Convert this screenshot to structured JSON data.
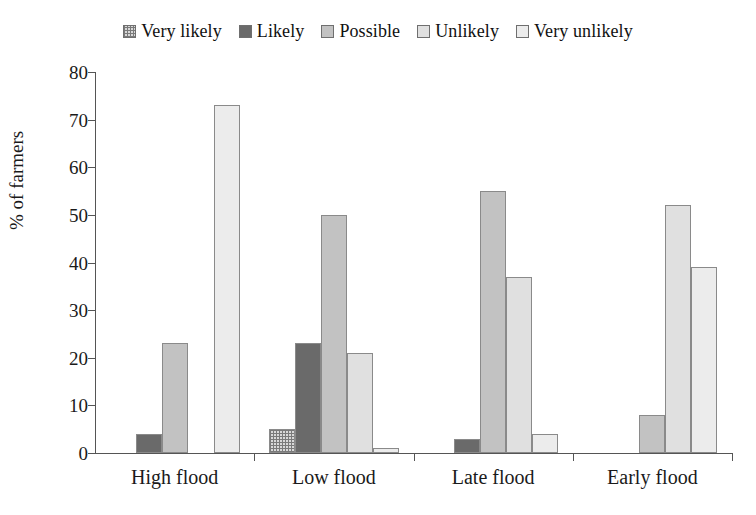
{
  "chart_data": {
    "type": "bar",
    "title": "",
    "subtitle": "",
    "xlabel": "",
    "ylabel": "% of farmers",
    "ylim": [
      0,
      80
    ],
    "yticks": [
      0,
      10,
      20,
      30,
      40,
      50,
      60,
      70,
      80
    ],
    "grid": false,
    "legend_position": "top-center",
    "categories": [
      "High flood",
      "Low flood",
      "Late flood",
      "Early flood"
    ],
    "series": [
      {
        "name": "Very likely",
        "color": "#d8d8d8",
        "pattern": "cross-hatch",
        "values": [
          0,
          5,
          0,
          0
        ]
      },
      {
        "name": "Likely",
        "color": "#6a6a6a",
        "pattern": "solid",
        "values": [
          4,
          23,
          3,
          0
        ]
      },
      {
        "name": "Possible",
        "color": "#c2c2c2",
        "pattern": "solid",
        "values": [
          23,
          50,
          55,
          8
        ]
      },
      {
        "name": "Unlikely",
        "color": "#e0e0e0",
        "pattern": "solid",
        "values": [
          0,
          21,
          37,
          52
        ]
      },
      {
        "name": "Very unlikely",
        "color": "#ececec",
        "pattern": "solid",
        "values": [
          73,
          1,
          4,
          39
        ]
      }
    ]
  },
  "legend": {
    "items": [
      {
        "label": "Very likely"
      },
      {
        "label": "Likely"
      },
      {
        "label": "Possible"
      },
      {
        "label": "Unlikely"
      },
      {
        "label": "Very unlikely"
      }
    ]
  },
  "axes": {
    "y_label": "% of farmers",
    "y_ticks": [
      "80",
      "70",
      "60",
      "50",
      "40",
      "30",
      "20",
      "10",
      "0"
    ],
    "x_categories": [
      "High flood",
      "Low flood",
      "Late flood",
      "Early flood"
    ]
  }
}
